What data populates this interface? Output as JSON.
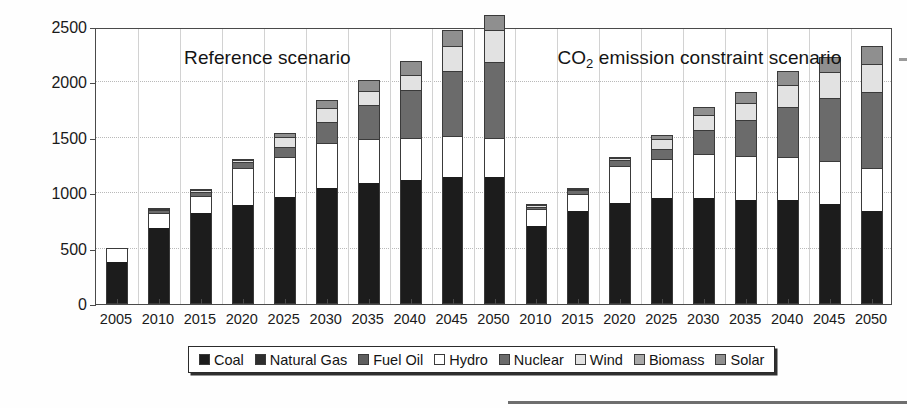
{
  "chart_data": {
    "type": "bar",
    "stacked": true,
    "title": "",
    "xlabel": "",
    "ylabel": "Capacity (GW)",
    "ylim": [
      0,
      2500
    ],
    "yticks": [
      0,
      500,
      1000,
      1500,
      2000,
      2500
    ],
    "ytick_labels": [
      "0",
      "500",
      "1000",
      "1500",
      "2000",
      "2500"
    ],
    "grid": true,
    "grid_axis": "both",
    "legend_position": "bottom-center",
    "annotations": [
      {
        "text": "Reference scenario",
        "x_category": "2015",
        "y": 2300
      },
      {
        "text": "CO2 emission constraint scenario",
        "x_category": "2030",
        "y": 2300
      }
    ],
    "series_names": [
      "Coal",
      "Natural Gas",
      "Fuel Oil",
      "Hydro",
      "Nuclear",
      "Wind",
      "Biomass",
      "Solar"
    ],
    "series_colors": [
      "#1c1c1c",
      "#2e2e2e",
      "#5e5e5e",
      "#ffffff",
      "#6b6b6b",
      "#e2e2e2",
      "#a8a8a8",
      "#8f8f8f"
    ],
    "groups": [
      {
        "name": "Reference scenario",
        "categories": [
          "2005",
          "2010",
          "2015",
          "2020",
          "2025",
          "2030",
          "2035",
          "2040",
          "2045",
          "2050"
        ],
        "series": [
          {
            "name": "Coal",
            "values": [
              375,
              685,
              825,
              895,
              970,
              1050,
              1090,
              1115,
              1150,
              1150
            ]
          },
          {
            "name": "Natural Gas",
            "values": [
              0,
              0,
              0,
              0,
              0,
              0,
              0,
              0,
              0,
              0
            ]
          },
          {
            "name": "Fuel Oil",
            "values": [
              0,
              0,
              0,
              0,
              0,
              0,
              0,
              0,
              0,
              0
            ]
          },
          {
            "name": "Hydro",
            "values": [
              135,
              140,
              150,
              330,
              360,
              400,
              400,
              380,
              370,
              350
            ]
          },
          {
            "name": "Nuclear",
            "values": [
              0,
              20,
              35,
              55,
              90,
              190,
              310,
              440,
              580,
              680
            ]
          },
          {
            "name": "Wind",
            "values": [
              0,
              10,
              15,
              20,
              90,
              125,
              125,
              130,
              230,
              290
            ]
          },
          {
            "name": "Biomass",
            "values": [
              0,
              0,
              0,
              0,
              0,
              0,
              0,
              0,
              0,
              0
            ]
          },
          {
            "name": "Solar",
            "values": [
              0,
              5,
              10,
              10,
              35,
              75,
              95,
              130,
              140,
              140
            ]
          }
        ],
        "totals": [
          510,
          860,
          1035,
          1310,
          1545,
          1840,
          2020,
          2195,
          2470,
          2610
        ]
      },
      {
        "name": "CO2 emission constraint scenario",
        "categories": [
          "2010",
          "2015",
          "2020",
          "2025",
          "2030",
          "2035",
          "2040",
          "2045",
          "2050"
        ],
        "series": [
          {
            "name": "Coal",
            "values": [
              705,
              840,
              915,
              955,
              960,
              935,
              935,
              905,
              840
            ]
          },
          {
            "name": "Natural Gas",
            "values": [
              0,
              0,
              0,
              0,
              0,
              0,
              0,
              0,
              0
            ]
          },
          {
            "name": "Fuel Oil",
            "values": [
              0,
              0,
              0,
              0,
              0,
              0,
              0,
              0,
              0
            ]
          },
          {
            "name": "Hydro",
            "values": [
              155,
              150,
              330,
              355,
              395,
              400,
              390,
              390,
              390
            ]
          },
          {
            "name": "Nuclear",
            "values": [
              20,
              35,
              55,
              90,
              220,
              330,
              450,
              560,
              680
            ]
          },
          {
            "name": "Wind",
            "values": [
              10,
              15,
              20,
              90,
              130,
              145,
              200,
              240,
              260
            ]
          },
          {
            "name": "Biomass",
            "values": [
              0,
              0,
              0,
              0,
              0,
              0,
              0,
              0,
              0
            ]
          },
          {
            "name": "Solar",
            "values": [
              5,
              10,
              10,
              35,
              75,
              105,
              130,
              130,
              155
            ]
          }
        ],
        "totals": [
          895,
          1050,
          1330,
          1525,
          1780,
          1915,
          2105,
          2225,
          2325
        ]
      }
    ]
  },
  "legend": {
    "items": [
      {
        "label": "Coal",
        "color": "#1c1c1c"
      },
      {
        "label": "Natural Gas",
        "color": "#2e2e2e"
      },
      {
        "label": "Fuel Oil",
        "color": "#5e5e5e"
      },
      {
        "label": "Hydro",
        "color": "#ffffff"
      },
      {
        "label": "Nuclear",
        "color": "#6b6b6b"
      },
      {
        "label": "Wind",
        "color": "#e2e2e2"
      },
      {
        "label": "Biomass",
        "color": "#a8a8a8"
      },
      {
        "label": "Solar",
        "color": "#8f8f8f"
      }
    ]
  },
  "axis": {
    "y_title": "Capacity (GW)",
    "y_tick_labels": [
      "2500",
      "2000",
      "1500",
      "1000",
      "500",
      "0"
    ]
  },
  "notes": {
    "reference": "Reference scenario",
    "co2_prefix": "CO",
    "co2_sub": "2",
    "co2_suffix": " emission constraint scenario"
  }
}
